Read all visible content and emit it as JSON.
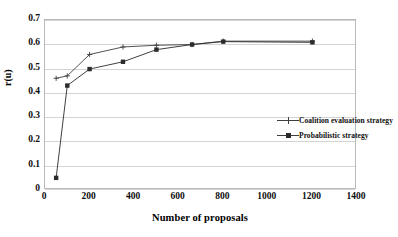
{
  "chart_data": {
    "type": "line",
    "title": "",
    "xlabel": "Number of proposals",
    "ylabel": "r(u)",
    "xlim": [
      0,
      1400
    ],
    "ylim": [
      0,
      0.7
    ],
    "xticks": [
      "0",
      "200",
      "400",
      "600",
      "800",
      "1000",
      "1200",
      "1400"
    ],
    "xtick_values": [
      0,
      200,
      400,
      600,
      800,
      1000,
      1200,
      1400
    ],
    "yticks": [
      "0",
      "0.1",
      "0.2",
      "0.3",
      "0.4",
      "0.5",
      "0.6",
      "0.7"
    ],
    "ytick_values": [
      0,
      0.1,
      0.2,
      0.3,
      0.4,
      0.5,
      0.6,
      0.7
    ],
    "grid": "horizontal",
    "legend_position": "center-right-inside",
    "series": [
      {
        "name": "Coalition evaluation strategy",
        "marker": "plus",
        "color": "#3f3f3f",
        "x": [
          50,
          100,
          200,
          350,
          500,
          660,
          800,
          1200
        ],
        "values": [
          0.46,
          0.47,
          0.558,
          0.589,
          0.596,
          0.599,
          0.613,
          0.613
        ]
      },
      {
        "name": "Probabilistic strategy",
        "marker": "square",
        "color": "#2b2b2b",
        "x": [
          50,
          100,
          200,
          350,
          500,
          660,
          800,
          1200
        ],
        "values": [
          0.05,
          0.43,
          0.498,
          0.528,
          0.578,
          0.599,
          0.611,
          0.608
        ]
      }
    ]
  },
  "legend": {
    "items": [
      {
        "label": "Coalition evaluation strategy",
        "marker": "plus"
      },
      {
        "label": "Probabilistic strategy",
        "marker": "square"
      }
    ]
  },
  "colors": {
    "background": "#ffffff",
    "gridline": "#d4d4d4",
    "frame": "#b9b9b9",
    "series_1": "#3f3f3f",
    "series_2": "#2b2b2b",
    "text": "#000000"
  }
}
